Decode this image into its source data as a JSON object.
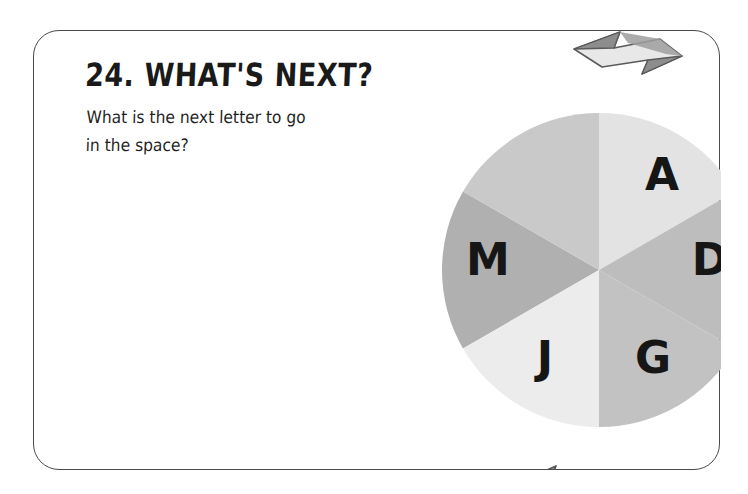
{
  "card": {
    "border_color": "#4a4a4a",
    "background": "#ffffff"
  },
  "puzzle": {
    "number": "24.",
    "title": "24. WHAT'S NEXT?",
    "question_line1": "What is the next letter to go",
    "question_line2": "in the space?"
  },
  "wheel": {
    "name": "letter-wheel",
    "sector_count": 6,
    "center_x": 313,
    "center_y": 239,
    "radius": 157,
    "sectors": [
      {
        "label": "",
        "position": "top-left",
        "start_angle": 240,
        "end_angle": 300,
        "color": "#b0b0b0",
        "is_empty": true,
        "letter_x": 250,
        "letter_y": 143
      },
      {
        "label": "A",
        "position": "top-right",
        "start_angle": 300,
        "end_angle": 360,
        "color": "#c9c9c9",
        "is_empty": false,
        "letter_x": 376,
        "letter_y": 143
      },
      {
        "label": "D",
        "position": "right",
        "start_angle": 0,
        "end_angle": 60,
        "color": "#e3e3e3",
        "is_empty": false,
        "letter_x": 424,
        "letter_y": 228
      },
      {
        "label": "G",
        "position": "bottom-right",
        "start_angle": 60,
        "end_angle": 120,
        "color": "#bdbdbd",
        "is_empty": false,
        "letter_x": 367,
        "letter_y": 326
      },
      {
        "label": "J",
        "position": "bottom-left",
        "start_angle": 120,
        "end_angle": 180,
        "color": "#c2c2c2",
        "is_empty": false,
        "letter_x": 259,
        "letter_y": 326
      },
      {
        "label": "M",
        "position": "left",
        "start_angle": 180,
        "end_angle": 240,
        "color": "#ececec",
        "is_empty": false,
        "letter_x": 202,
        "letter_y": 228
      }
    ]
  },
  "arrows": [
    {
      "name": "rotation-arrow-top-right",
      "fill": "#e8e8e8",
      "shade": "#8d8d8d",
      "stroke": "#5a5a5a"
    },
    {
      "name": "rotation-arrow-bottom-left",
      "fill": "#e8e8e8",
      "shade": "#8d8d8d",
      "stroke": "#5a5a5a"
    }
  ]
}
